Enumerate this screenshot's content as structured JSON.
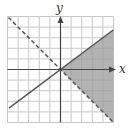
{
  "graph": {
    "x_axis_label": "x",
    "y_axis_label": "y",
    "grid": {
      "xmin": -5,
      "xmax": 5,
      "ymin": -5,
      "ymax": 5,
      "step": 1
    },
    "boundary_solid": {
      "equation": "y = 0.75x",
      "style": "solid"
    },
    "boundary_dashed": {
      "equation": "y = -x",
      "style": "dashed"
    },
    "shaded_region": "y <= 0.75x and y > -x",
    "colors": {
      "shade": "#9a9a9a",
      "grid": "#c8c8c8",
      "lines": "#555555",
      "axes": "#444444"
    }
  }
}
